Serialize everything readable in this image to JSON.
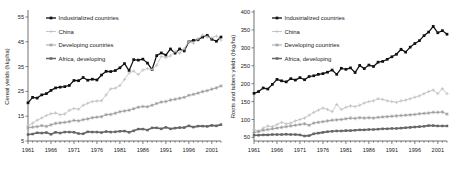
{
  "figure": {
    "panels": [
      "left",
      "right"
    ]
  },
  "colors": {
    "industrialized": "#111111",
    "china": "#c0c0c0",
    "developing": "#999999",
    "africa": "#666666",
    "frame": "#4d4d4d",
    "text": "#1a1a1a",
    "background": "#ffffff"
  },
  "chart_data": [
    {
      "type": "line",
      "panel": "left",
      "title": "",
      "xlabel": "",
      "ylabel": "Cereal yields (hkg/ha)",
      "xlim": [
        1961,
        2003
      ],
      "ylim": [
        5,
        57
      ],
      "yticks": [
        5,
        15,
        25,
        35,
        45,
        55
      ],
      "xticks": [
        1961,
        1966,
        1971,
        1976,
        1981,
        1986,
        1991,
        1996,
        2001
      ],
      "grid": false,
      "legend_position": "top-left",
      "x": [
        1961,
        1962,
        1963,
        1964,
        1965,
        1966,
        1967,
        1968,
        1969,
        1970,
        1971,
        1972,
        1973,
        1974,
        1975,
        1976,
        1977,
        1978,
        1979,
        1980,
        1981,
        1982,
        1983,
        1984,
        1985,
        1986,
        1987,
        1988,
        1989,
        1990,
        1991,
        1992,
        1993,
        1994,
        1995,
        1996,
        1997,
        1998,
        1999,
        2000,
        2001,
        2002,
        2003
      ],
      "series": [
        {
          "name": "Industrialized countries",
          "color": "#111111",
          "marker": "square-filled",
          "values": [
            20.4,
            22.6,
            22.3,
            23.6,
            24.1,
            25.4,
            26.4,
            26.7,
            26.9,
            27.4,
            29.4,
            29.3,
            30.6,
            29.5,
            29.9,
            29.6,
            31.6,
            33.1,
            33.0,
            33.4,
            34.5,
            36.2,
            33.4,
            37.8,
            37.6,
            38.0,
            36.4,
            33.8,
            39.4,
            40.5,
            39.6,
            42.1,
            40.4,
            42.1,
            41.3,
            45.0,
            45.6,
            45.8,
            46.9,
            47.6,
            46.0,
            45.2,
            46.9
          ]
        },
        {
          "name": "China",
          "color": "#c0c0c0",
          "marker": "plus",
          "values": [
            11.1,
            12.2,
            13.4,
            14.3,
            15.3,
            16.0,
            16.3,
            15.6,
            15.9,
            17.4,
            18.1,
            17.8,
            19.4,
            20.2,
            20.9,
            21.1,
            21.2,
            23.6,
            26.0,
            26.3,
            27.4,
            29.8,
            32.4,
            33.2,
            31.8,
            33.6,
            34.2,
            33.8,
            35.5,
            39.1,
            38.6,
            39.3,
            41.2,
            40.4,
            42.2,
            45.0,
            44.4,
            46.2,
            47.7,
            46.9,
            46.6,
            47.3,
            45.7
          ]
        },
        {
          "name": "Developing countries",
          "color": "#999999",
          "marker": "star",
          "values": [
            10.3,
            10.6,
            10.8,
            11.2,
            10.9,
            11.5,
            12.1,
            12.3,
            12.5,
            12.8,
            13.3,
            13.1,
            13.6,
            13.9,
            14.4,
            14.6,
            14.8,
            15.6,
            15.7,
            16.2,
            16.8,
            17.1,
            17.4,
            18.0,
            18.6,
            18.9,
            18.8,
            19.4,
            20.1,
            20.7,
            20.9,
            21.5,
            21.8,
            22.2,
            22.6,
            23.4,
            23.8,
            24.3,
            24.9,
            25.3,
            25.9,
            26.4,
            27.2
          ]
        },
        {
          "name": "Africa, developing",
          "color": "#666666",
          "marker": "square-thick",
          "values": [
            7.6,
            7.8,
            8.3,
            8.2,
            8.4,
            7.7,
            8.5,
            8.2,
            8.6,
            8.6,
            8.5,
            8.0,
            7.9,
            8.7,
            8.6,
            8.6,
            8.4,
            8.8,
            8.6,
            8.7,
            8.9,
            9.0,
            8.5,
            9.1,
            9.8,
            9.8,
            9.4,
            10.3,
            10.3,
            9.9,
            10.5,
            9.9,
            10.2,
            10.4,
            10.4,
            11.1,
            10.6,
            11.0,
            11.0,
            10.9,
            11.3,
            11.1,
            11.6
          ]
        }
      ]
    },
    {
      "type": "line",
      "panel": "right",
      "title": "",
      "xlabel": "",
      "ylabel": "Roots and tubers yields (hkg/ha)",
      "xlim": [
        1961,
        2003
      ],
      "ylim": [
        40,
        400
      ],
      "yticks": [
        50,
        100,
        150,
        200,
        250,
        300,
        350,
        400
      ],
      "xticks": [
        1961,
        1966,
        1971,
        1976,
        1981,
        1986,
        1991,
        1996,
        2001
      ],
      "grid": false,
      "legend_position": "top-left",
      "x": [
        1961,
        1962,
        1963,
        1964,
        1965,
        1966,
        1967,
        1968,
        1969,
        1970,
        1971,
        1972,
        1973,
        1974,
        1975,
        1976,
        1977,
        1978,
        1979,
        1980,
        1981,
        1982,
        1983,
        1984,
        1985,
        1986,
        1987,
        1988,
        1989,
        1990,
        1991,
        1992,
        1993,
        1994,
        1995,
        1996,
        1997,
        1998,
        1999,
        2000,
        2001,
        2002,
        2003
      ],
      "series": [
        {
          "name": "Industrialized countries",
          "color": "#111111",
          "marker": "square-filled",
          "values": [
            173,
            178,
            188,
            185,
            198,
            212,
            208,
            205,
            214,
            210,
            217,
            211,
            220,
            222,
            226,
            228,
            232,
            238,
            226,
            243,
            240,
            244,
            231,
            251,
            242,
            252,
            248,
            260,
            262,
            268,
            275,
            282,
            296,
            288,
            302,
            312,
            320,
            334,
            344,
            360,
            342,
            348,
            338
          ]
        },
        {
          "name": "China",
          "color": "#c0c0c0",
          "marker": "plus",
          "values": [
            72,
            68,
            76,
            82,
            80,
            86,
            92,
            88,
            90,
            96,
            100,
            104,
            112,
            120,
            126,
            132,
            128,
            122,
            142,
            128,
            134,
            138,
            136,
            140,
            146,
            150,
            152,
            158,
            156,
            152,
            150,
            148,
            152,
            154,
            158,
            162,
            166,
            172,
            178,
            182,
            172,
            186,
            172
          ]
        },
        {
          "name": "Developing countries",
          "color": "#999999",
          "marker": "star",
          "values": [
            64,
            66,
            70,
            72,
            74,
            76,
            78,
            80,
            82,
            84,
            86,
            88,
            84,
            90,
            92,
            94,
            96,
            98,
            99,
            100,
            102,
            104,
            103,
            105,
            104,
            105,
            104,
            106,
            107,
            108,
            109,
            110,
            111,
            112,
            113,
            114,
            116,
            117,
            118,
            120,
            120,
            121,
            115
          ]
        },
        {
          "name": "Africa, developing",
          "color": "#666666",
          "marker": "square-thick",
          "values": [
            56,
            56,
            57,
            57,
            58,
            58,
            58,
            59,
            58,
            58,
            57,
            54,
            55,
            60,
            62,
            64,
            66,
            67,
            68,
            68,
            69,
            69,
            70,
            71,
            71,
            72,
            72,
            73,
            74,
            74,
            75,
            75,
            76,
            77,
            78,
            79,
            80,
            81,
            83,
            83,
            82,
            82,
            82
          ]
        }
      ]
    }
  ]
}
